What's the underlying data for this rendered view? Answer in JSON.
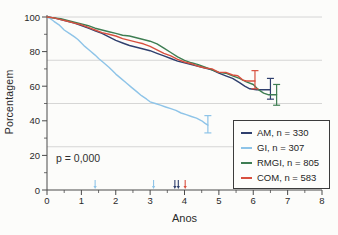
{
  "figure": {
    "background_color": "#fcfcfa",
    "axis_color": "#4a4a4a",
    "grid_color": "#cccccc",
    "text_color": "#2a2a2a"
  },
  "chart_data": {
    "type": "line",
    "subtype": "kaplan-meier-survival",
    "title": "",
    "xlabel": "Anos",
    "ylabel": "Porcentagem",
    "xlim": [
      0,
      8
    ],
    "ylim": [
      0,
      100
    ],
    "x_major_ticks": [
      0,
      1,
      2,
      3,
      4,
      5,
      6,
      7,
      8
    ],
    "x_minor_tick_step": 0.5,
    "y_major_ticks": [
      0,
      20,
      40,
      60,
      80,
      100
    ],
    "y_minor_ticks": [
      10,
      30,
      50,
      70,
      90
    ],
    "gridlines_y": [
      25,
      50,
      75,
      100
    ],
    "grid_on": true,
    "legend_position": "lower right",
    "annotation": {
      "text": "p = 0,000"
    },
    "series": [
      {
        "name": "AM",
        "label": "AM, n = 330",
        "n": 330,
        "color": "#2f3f6d",
        "points": [
          [
            0,
            100
          ],
          [
            0.2,
            99.5
          ],
          [
            0.4,
            98.5
          ],
          [
            0.6,
            97.5
          ],
          [
            0.8,
            96.5
          ],
          [
            1.0,
            95
          ],
          [
            1.2,
            93.5
          ],
          [
            1.4,
            92
          ],
          [
            1.6,
            90.5
          ],
          [
            1.8,
            88.5
          ],
          [
            2.0,
            86.5
          ],
          [
            2.2,
            85
          ],
          [
            2.4,
            83.5
          ],
          [
            2.6,
            82.5
          ],
          [
            2.8,
            81.5
          ],
          [
            3.0,
            80.5
          ],
          [
            3.2,
            79
          ],
          [
            3.4,
            77.5
          ],
          [
            3.6,
            76
          ],
          [
            3.8,
            74.5
          ],
          [
            4.0,
            73.5
          ],
          [
            4.2,
            72.5
          ],
          [
            4.4,
            71.5
          ],
          [
            4.6,
            70.5
          ],
          [
            4.8,
            69.5
          ],
          [
            5.0,
            67.5
          ],
          [
            5.2,
            66
          ],
          [
            5.4,
            64.5
          ],
          [
            5.6,
            62
          ],
          [
            5.75,
            60
          ],
          [
            5.9,
            58.5
          ],
          [
            6.1,
            58
          ],
          [
            6.5,
            58
          ]
        ],
        "error_bar": {
          "x": 6.5,
          "low": 52.5,
          "high": 64.5
        },
        "censor_marks_x": [
          3.72,
          3.82
        ]
      },
      {
        "name": "GI",
        "label": "GI, n = 307",
        "n": 307,
        "color": "#8ec4e8",
        "points": [
          [
            0,
            100
          ],
          [
            0.1,
            99
          ],
          [
            0.2,
            97.5
          ],
          [
            0.35,
            95.5
          ],
          [
            0.5,
            92.5
          ],
          [
            0.65,
            90.5
          ],
          [
            0.8,
            88.5
          ],
          [
            0.9,
            87
          ],
          [
            1.0,
            85
          ],
          [
            1.1,
            83
          ],
          [
            1.25,
            80.5
          ],
          [
            1.4,
            78
          ],
          [
            1.5,
            76
          ],
          [
            1.65,
            73.5
          ],
          [
            1.8,
            71
          ],
          [
            1.9,
            69
          ],
          [
            2.0,
            67
          ],
          [
            2.15,
            64.5
          ],
          [
            2.3,
            62
          ],
          [
            2.45,
            59.5
          ],
          [
            2.6,
            57
          ],
          [
            2.75,
            54.5
          ],
          [
            2.9,
            52.5
          ],
          [
            3.0,
            51
          ],
          [
            3.15,
            50
          ],
          [
            3.3,
            49
          ],
          [
            3.45,
            48
          ],
          [
            3.6,
            47
          ],
          [
            3.75,
            46
          ],
          [
            3.9,
            44.5
          ],
          [
            4.05,
            43.5
          ],
          [
            4.2,
            42.5
          ],
          [
            4.35,
            41.5
          ],
          [
            4.5,
            40
          ],
          [
            4.6,
            38.5
          ],
          [
            4.68,
            37.5
          ]
        ],
        "error_bar": {
          "x": 4.68,
          "low": 33,
          "high": 43
        },
        "censor_marks_x": [
          1.4,
          3.1
        ]
      },
      {
        "name": "RMGI",
        "label": "RMGI, n = 805",
        "n": 805,
        "color": "#3e7d52",
        "points": [
          [
            0,
            100
          ],
          [
            0.2,
            99.5
          ],
          [
            0.4,
            99
          ],
          [
            0.6,
            98
          ],
          [
            0.8,
            97
          ],
          [
            1.0,
            96
          ],
          [
            1.2,
            95
          ],
          [
            1.4,
            93.5
          ],
          [
            1.6,
            92.5
          ],
          [
            1.8,
            91.5
          ],
          [
            2.0,
            90.5
          ],
          [
            2.2,
            89.5
          ],
          [
            2.4,
            89
          ],
          [
            2.6,
            88
          ],
          [
            2.8,
            87
          ],
          [
            3.0,
            86
          ],
          [
            3.2,
            84.5
          ],
          [
            3.4,
            82
          ],
          [
            3.6,
            79.5
          ],
          [
            3.8,
            77
          ],
          [
            4.0,
            75
          ],
          [
            4.2,
            73.5
          ],
          [
            4.4,
            72.5
          ],
          [
            4.6,
            71
          ],
          [
            4.8,
            69.5
          ],
          [
            5.0,
            68
          ],
          [
            5.2,
            67.5
          ],
          [
            5.4,
            66
          ],
          [
            5.6,
            64.5
          ],
          [
            5.8,
            62.5
          ],
          [
            6.0,
            61
          ],
          [
            6.15,
            58
          ],
          [
            6.3,
            56
          ],
          [
            6.45,
            55
          ],
          [
            6.68,
            55
          ]
        ],
        "error_bar": {
          "x": 6.68,
          "low": 49,
          "high": 61
        },
        "censor_marks_x": []
      },
      {
        "name": "COM",
        "label": "COM, n = 583",
        "n": 583,
        "color": "#d8503f",
        "points": [
          [
            0,
            100
          ],
          [
            0.2,
            99.5
          ],
          [
            0.4,
            98.5
          ],
          [
            0.6,
            97.5
          ],
          [
            0.8,
            96.5
          ],
          [
            1.0,
            95.5
          ],
          [
            1.2,
            94
          ],
          [
            1.4,
            92.5
          ],
          [
            1.6,
            91
          ],
          [
            1.8,
            90
          ],
          [
            2.0,
            89
          ],
          [
            2.2,
            87.5
          ],
          [
            2.4,
            86.5
          ],
          [
            2.6,
            85.5
          ],
          [
            2.8,
            84.5
          ],
          [
            3.0,
            83
          ],
          [
            3.2,
            81
          ],
          [
            3.4,
            79
          ],
          [
            3.6,
            77.5
          ],
          [
            3.8,
            75.5
          ],
          [
            4.0,
            74
          ],
          [
            4.2,
            73
          ],
          [
            4.4,
            71.5
          ],
          [
            4.6,
            70.5
          ],
          [
            4.8,
            70
          ],
          [
            5.0,
            68
          ],
          [
            5.2,
            68
          ],
          [
            5.4,
            66.5
          ],
          [
            5.55,
            66
          ],
          [
            5.7,
            63.5
          ],
          [
            5.8,
            63
          ],
          [
            6.05,
            63
          ]
        ],
        "error_bar": {
          "x": 6.05,
          "low": 58.5,
          "high": 69
        },
        "censor_marks_x": [
          4.02
        ]
      }
    ]
  }
}
